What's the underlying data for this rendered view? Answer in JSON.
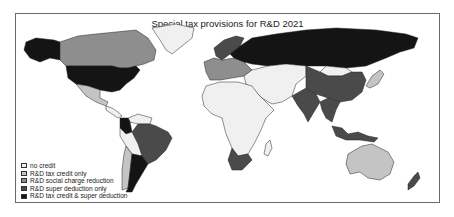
{
  "map": {
    "title": "Special tax provisions for R&D 2021",
    "legend": [
      {
        "key": "no_credit",
        "label": "no credit",
        "color": "#f0f0f0"
      },
      {
        "key": "tax_credit",
        "label": "R&D tax credit only",
        "color": "#c4c4c4"
      },
      {
        "key": "social_charge",
        "label": "R&D social charge reduction",
        "color": "#8e8e8e"
      },
      {
        "key": "super_deduction",
        "label": "R&D super deduction only",
        "color": "#4a4a4a"
      },
      {
        "key": "both",
        "label": "R&D tax credit & super deduction",
        "color": "#141414"
      }
    ],
    "regions": [
      {
        "name": "Alaska (USA)",
        "category": "both"
      },
      {
        "name": "Canada",
        "category": "social_charge"
      },
      {
        "name": "Greenland",
        "category": "no_credit"
      },
      {
        "name": "United States",
        "category": "both"
      },
      {
        "name": "Mexico",
        "category": "tax_credit"
      },
      {
        "name": "Central America",
        "category": "no_credit"
      },
      {
        "name": "Colombia",
        "category": "both"
      },
      {
        "name": "Venezuela/Guianas",
        "category": "no_credit"
      },
      {
        "name": "Brazil",
        "category": "super_deduction"
      },
      {
        "name": "Peru/Bolivia",
        "category": "no_credit"
      },
      {
        "name": "Chile",
        "category": "tax_credit"
      },
      {
        "name": "Argentina",
        "category": "both"
      },
      {
        "name": "Western Europe",
        "category": "social_charge"
      },
      {
        "name": "Scandinavia",
        "category": "super_deduction"
      },
      {
        "name": "Russia",
        "category": "both"
      },
      {
        "name": "Africa",
        "category": "no_credit"
      },
      {
        "name": "South Africa",
        "category": "super_deduction"
      },
      {
        "name": "Middle East / Central Asia",
        "category": "no_credit"
      },
      {
        "name": "China",
        "category": "super_deduction"
      },
      {
        "name": "India",
        "category": "super_deduction"
      },
      {
        "name": "Mongolia",
        "category": "no_credit"
      },
      {
        "name": "Southeast Asia",
        "category": "super_deduction"
      },
      {
        "name": "Japan",
        "category": "tax_credit"
      },
      {
        "name": "Australia",
        "category": "tax_credit"
      },
      {
        "name": "New Zealand",
        "category": "super_deduction"
      },
      {
        "name": "Indonesia",
        "category": "super_deduction"
      }
    ]
  }
}
